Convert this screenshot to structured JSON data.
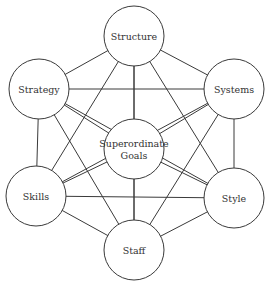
{
  "diagram": {
    "title": "",
    "nodes": [
      {
        "id": "structure",
        "label": "Structure",
        "lines": [
          "Structure"
        ],
        "cx": 134,
        "cy": 36,
        "r": 30
      },
      {
        "id": "strategy",
        "label": "Strategy",
        "lines": [
          "Strategy"
        ],
        "cx": 39,
        "cy": 89,
        "r": 30
      },
      {
        "id": "systems",
        "label": "Systems",
        "lines": [
          "Systems"
        ],
        "cx": 234,
        "cy": 89,
        "r": 30
      },
      {
        "id": "goals",
        "label": "Superordinate Goals",
        "lines": [
          "Superordinate",
          "Goals"
        ],
        "cx": 134,
        "cy": 149,
        "r": 30
      },
      {
        "id": "skills",
        "label": "Skills",
        "lines": [
          "Skills"
        ],
        "cx": 36,
        "cy": 196,
        "r": 30
      },
      {
        "id": "style",
        "label": "Style",
        "lines": [
          "Style"
        ],
        "cx": 234,
        "cy": 198,
        "r": 30
      },
      {
        "id": "staff",
        "label": "Staff",
        "lines": [
          "Staff"
        ],
        "cx": 134,
        "cy": 250,
        "r": 30
      }
    ],
    "edges": [
      [
        "structure",
        "strategy"
      ],
      [
        "structure",
        "systems"
      ],
      [
        "structure",
        "goals"
      ],
      [
        "structure",
        "skills"
      ],
      [
        "structure",
        "style"
      ],
      [
        "structure",
        "staff"
      ],
      [
        "strategy",
        "systems"
      ],
      [
        "strategy",
        "goals"
      ],
      [
        "strategy",
        "skills"
      ],
      [
        "strategy",
        "style"
      ],
      [
        "strategy",
        "staff"
      ],
      [
        "systems",
        "goals"
      ],
      [
        "systems",
        "skills"
      ],
      [
        "systems",
        "style"
      ],
      [
        "systems",
        "staff"
      ],
      [
        "goals",
        "skills"
      ],
      [
        "goals",
        "style"
      ],
      [
        "goals",
        "staff"
      ],
      [
        "skills",
        "style"
      ],
      [
        "skills",
        "staff"
      ],
      [
        "style",
        "staff"
      ]
    ],
    "colors": {
      "line": "#3a3a3a",
      "text": "#333333",
      "fill": "#ffffff"
    }
  }
}
